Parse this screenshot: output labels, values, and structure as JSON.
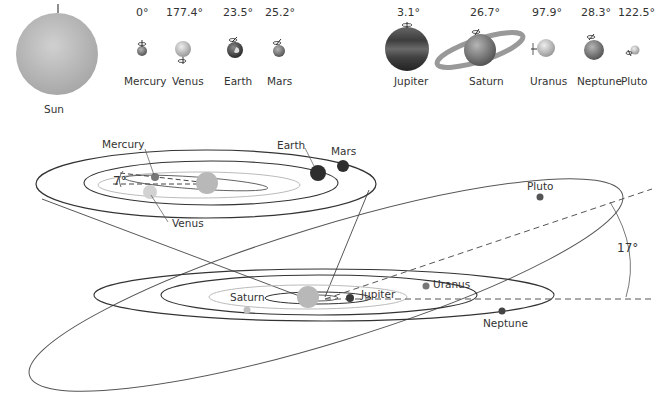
{
  "top_row": {
    "sun": {
      "label": "Sun"
    },
    "planets": [
      {
        "name": "Mercury",
        "tilt": "0°"
      },
      {
        "name": "Venus",
        "tilt": "177.4°"
      },
      {
        "name": "Earth",
        "tilt": "23.5°"
      },
      {
        "name": "Mars",
        "tilt": "25.2°"
      },
      {
        "name": "Jupiter",
        "tilt": "3.1°"
      },
      {
        "name": "Saturn",
        "tilt": "26.7°"
      },
      {
        "name": "Uranus",
        "tilt": "97.9°"
      },
      {
        "name": "Neptune",
        "tilt": "28.3°"
      },
      {
        "name": "Pluto",
        "tilt": "122.5°"
      }
    ]
  },
  "inner_orbits": {
    "labels": {
      "mercury": "Mercury",
      "venus": "Venus",
      "earth": "Earth",
      "mars": "Mars"
    },
    "mercury_inclination": "7°"
  },
  "outer_orbits": {
    "labels": {
      "saturn": "Saturn",
      "jupiter": "Jupiter",
      "uranus": "Uranus",
      "neptune": "Neptune",
      "pluto": "Pluto"
    },
    "pluto_inclination": "17°"
  },
  "colors": {
    "line": "#444444",
    "light_orbit": "#bbbbbb",
    "sun": "#b8b8b8",
    "dark_planet": "#3a3a3a",
    "mid_planet": "#777777",
    "light_planet": "#c8c8c8"
  }
}
